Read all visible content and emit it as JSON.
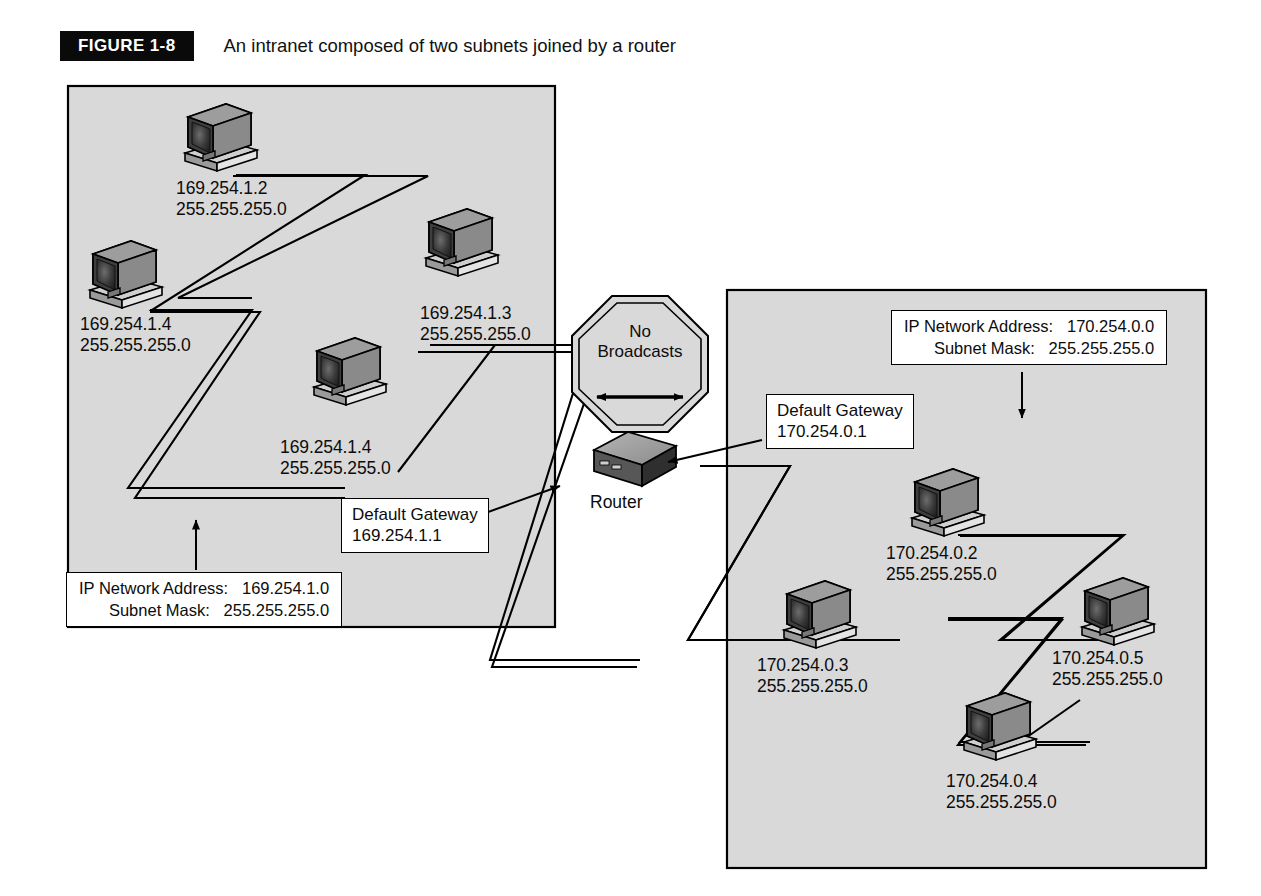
{
  "figure": {
    "tag": "FIGURE  1-8",
    "title": "An intranet composed of two subnets joined by a router"
  },
  "colors": {
    "subnet_fill": "#d9d9d9",
    "subnet_stroke": "#000000",
    "line": "#000000",
    "box_fill": "#ffffff",
    "monitor_dark": "#2b2b2b",
    "monitor_mid": "#6e6e6e",
    "monitor_light": "#bdbdbd",
    "router_top": "#9a9a9a",
    "router_front": "#6b6b6b",
    "router_side": "#3d3d3d"
  },
  "left_subnet": {
    "name": "left-subnet",
    "info": {
      "label_network": "IP Network Address:",
      "value_network": "169.254.1.0",
      "label_mask": "Subnet Mask:",
      "value_mask": "255.255.255.0"
    },
    "gateway": {
      "title": "Default Gateway",
      "address": "169.254.1.1"
    },
    "hosts": [
      {
        "name": "host-169-254-1-2",
        "ip": "169.254.1.2",
        "mask": "255.255.255.0"
      },
      {
        "name": "host-169-254-1-4-upper",
        "ip": "169.254.1.4",
        "mask": "255.255.255.0"
      },
      {
        "name": "host-169-254-1-3",
        "ip": "169.254.1.3",
        "mask": "255.255.255.0"
      },
      {
        "name": "host-169-254-1-4-lower",
        "ip": "169.254.1.4",
        "mask": "255.255.255.0"
      }
    ]
  },
  "right_subnet": {
    "name": "right-subnet",
    "info": {
      "label_network": "IP Network Address:",
      "value_network": "170.254.0.0",
      "label_mask": "Subnet Mask:",
      "value_mask": "255.255.255.0"
    },
    "gateway": {
      "title": "Default Gateway",
      "address": "170.254.0.1"
    },
    "hosts": [
      {
        "name": "host-170-254-0-2",
        "ip": "170.254.0.2",
        "mask": "255.255.255.0"
      },
      {
        "name": "host-170-254-0-3",
        "ip": "170.254.0.3",
        "mask": "255.255.255.0"
      },
      {
        "name": "host-170-254-0-5",
        "ip": "170.254.0.5",
        "mask": "255.255.255.0"
      },
      {
        "name": "host-170-254-0-4",
        "ip": "170.254.0.4",
        "mask": "255.255.255.0"
      }
    ]
  },
  "router": {
    "label": "Router"
  },
  "broadcast_sign": {
    "line1": "No",
    "line2": "Broadcasts",
    "arrow": "double-headed-horizontal-arrow"
  }
}
